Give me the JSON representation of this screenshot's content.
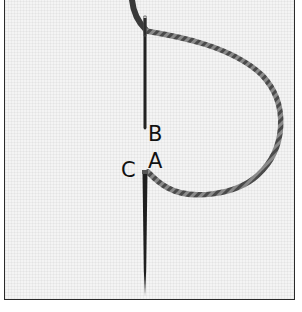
{
  "diagram": {
    "type": "embroidery-stitch-instruction",
    "labels": {
      "a": "A",
      "b": "B",
      "c": "C"
    },
    "colors": {
      "frame_border": "#2a2a2a",
      "fabric": "#f4f4f4",
      "needle": "#222222",
      "thread": "#6a6a6a"
    }
  }
}
